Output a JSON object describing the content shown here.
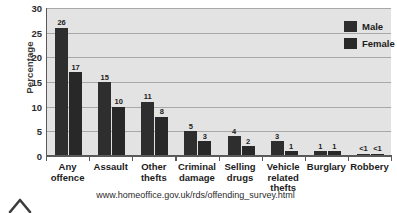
{
  "chart_data": {
    "type": "bar",
    "title": "",
    "subtitle": "",
    "xlabel": "",
    "ylabel": "Percentage",
    "ylim": [
      0,
      30
    ],
    "yticks": [
      0,
      5,
      10,
      15,
      20,
      25,
      30
    ],
    "grid": true,
    "legend_position": "top-right",
    "categories": [
      "Any offence",
      "Assault",
      "Other thefts",
      "Criminal damage",
      "Selling drugs",
      "Vehicle related thefts",
      "Burglary",
      "Robbery"
    ],
    "category_lines": [
      [
        "Any",
        "offence"
      ],
      [
        "Assault"
      ],
      [
        "Other",
        "thefts"
      ],
      [
        "Criminal",
        "damage"
      ],
      [
        "Selling",
        "drugs"
      ],
      [
        "Vehicle",
        "related",
        "thefts"
      ],
      [
        "Burglary"
      ],
      [
        "Robbery"
      ]
    ],
    "series": [
      {
        "name": "Male",
        "color": "#2e2e2e",
        "values": [
          26,
          15,
          11,
          5,
          4,
          3,
          1,
          0.5
        ],
        "labels": [
          "26",
          "15",
          "11",
          "5",
          "4",
          "3",
          "1",
          "<1"
        ]
      },
      {
        "name": "Female",
        "color": "#282828",
        "values": [
          17,
          10,
          8,
          3,
          2,
          1,
          1,
          0.5
        ],
        "labels": [
          "17",
          "10",
          "8",
          "3",
          "2",
          "1",
          "1",
          "<1"
        ]
      }
    ]
  },
  "legend": {
    "items": [
      {
        "label": "Male"
      },
      {
        "label": "Female"
      }
    ]
  },
  "footer": {
    "source_url": "www.homeoffice.gov.uk/rds/offending_survey.html"
  }
}
